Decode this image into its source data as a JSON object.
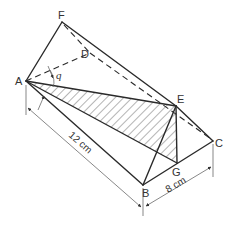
{
  "figure": {
    "type": "3d-prism-geometry",
    "vertices": {
      "A": {
        "label": "A",
        "x": 26,
        "y": 81
      },
      "F": {
        "label": "F",
        "x": 62,
        "y": 22
      },
      "D": {
        "label": "D",
        "x": 90,
        "y": 53
      },
      "E": {
        "label": "E",
        "x": 176,
        "y": 106
      },
      "C": {
        "label": "C",
        "x": 213,
        "y": 141
      },
      "B": {
        "label": "B",
        "x": 143,
        "y": 185
      },
      "G": {
        "label": "G",
        "x": 177,
        "y": 163
      }
    },
    "angle_label": "q",
    "dimensions": {
      "length": "12 cm",
      "width": "8 cm"
    },
    "colors": {
      "line": "#2a2a2a",
      "hatch": "#444444",
      "text": "#333333",
      "background": "#ffffff"
    }
  }
}
